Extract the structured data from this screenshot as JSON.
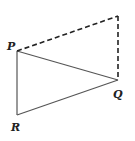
{
  "diagram": {
    "type": "geometry",
    "colors": {
      "background": "#ffffff",
      "solid_line": "#555555",
      "dashed_line": "#222222",
      "label": "#222222"
    },
    "points": {
      "P": {
        "label": "P",
        "x": 17,
        "y": 51,
        "label_x": 7,
        "label_y": 50
      },
      "Q": {
        "label": "Q",
        "x": 118,
        "y": 80,
        "label_x": 113,
        "label_y": 98
      },
      "R": {
        "label": "R",
        "x": 17,
        "y": 115,
        "label_x": 11,
        "label_y": 131
      },
      "S": {
        "label": "",
        "x": 118,
        "y": 16
      }
    },
    "segments": [
      {
        "from": "P",
        "to": "Q",
        "style": "solid"
      },
      {
        "from": "P",
        "to": "R",
        "style": "solid"
      },
      {
        "from": "R",
        "to": "Q",
        "style": "solid"
      },
      {
        "from": "P",
        "to": "S",
        "style": "dashed"
      },
      {
        "from": "S",
        "to": "Q",
        "style": "dashed"
      }
    ],
    "labels": {
      "P": "P",
      "Q": "Q",
      "R": "R"
    }
  }
}
